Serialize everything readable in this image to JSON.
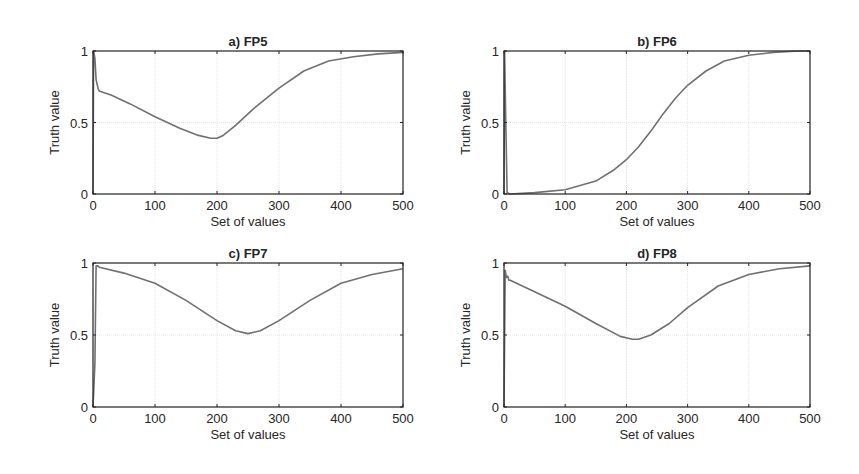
{
  "figure": {
    "line_color": "#707070",
    "axis_color": "#262626",
    "grid_color": "#e4e4e4"
  },
  "chart_data": [
    {
      "id": "a",
      "type": "line",
      "title": "a) FP5",
      "xlabel": "Set of values",
      "ylabel": "Truth value",
      "xlim": [
        0,
        500
      ],
      "ylim": [
        0,
        1
      ],
      "xticks": [
        0,
        100,
        200,
        300,
        400,
        500
      ],
      "yticks": [
        0,
        0.5,
        1
      ],
      "ytick_labels": [
        "0",
        "0.5",
        "1"
      ],
      "grid": true,
      "x": [
        0,
        1,
        3,
        5,
        8,
        10,
        30,
        60,
        100,
        140,
        170,
        190,
        200,
        210,
        230,
        260,
        300,
        340,
        380,
        420,
        460,
        500
      ],
      "y": [
        0,
        1,
        0.95,
        0.8,
        0.74,
        0.72,
        0.69,
        0.63,
        0.54,
        0.46,
        0.41,
        0.39,
        0.39,
        0.41,
        0.48,
        0.6,
        0.74,
        0.86,
        0.93,
        0.96,
        0.98,
        0.99
      ]
    },
    {
      "id": "b",
      "type": "line",
      "title": "b) FP6",
      "xlabel": "Set of values",
      "ylabel": "Truth value",
      "xlim": [
        0,
        500
      ],
      "ylim": [
        0,
        1
      ],
      "xticks": [
        0,
        100,
        200,
        300,
        400,
        500
      ],
      "yticks": [
        0,
        0.5,
        1
      ],
      "ytick_labels": [
        "0",
        "0.5",
        "1"
      ],
      "grid": true,
      "x": [
        0,
        1,
        3,
        5,
        10,
        50,
        100,
        150,
        180,
        200,
        220,
        240,
        250,
        260,
        280,
        300,
        330,
        360,
        400,
        440,
        480,
        500
      ],
      "y": [
        0,
        1,
        0.5,
        0.01,
        0.0,
        0.01,
        0.03,
        0.09,
        0.17,
        0.24,
        0.33,
        0.44,
        0.5,
        0.56,
        0.67,
        0.76,
        0.86,
        0.93,
        0.97,
        0.99,
        1.0,
        1.0
      ]
    },
    {
      "id": "c",
      "type": "line",
      "title": "c) FP7",
      "xlabel": "Set of values",
      "ylabel": "Truth value",
      "xlim": [
        0,
        500
      ],
      "ylim": [
        0,
        1
      ],
      "xticks": [
        0,
        100,
        200,
        300,
        400,
        500
      ],
      "yticks": [
        0,
        0.5,
        1
      ],
      "ytick_labels": [
        "0",
        "0.5",
        "1"
      ],
      "grid": true,
      "x": [
        0,
        3,
        5,
        8,
        10,
        50,
        100,
        150,
        200,
        230,
        250,
        270,
        300,
        350,
        400,
        450,
        500
      ],
      "y": [
        0,
        0.3,
        0.98,
        0.98,
        0.97,
        0.93,
        0.86,
        0.74,
        0.6,
        0.53,
        0.51,
        0.53,
        0.6,
        0.74,
        0.86,
        0.92,
        0.96
      ]
    },
    {
      "id": "d",
      "type": "line",
      "title": "d) FP8",
      "xlabel": "Set of values",
      "ylabel": "Truth value",
      "xlim": [
        0,
        500
      ],
      "ylim": [
        0,
        1
      ],
      "xticks": [
        0,
        100,
        200,
        300,
        400,
        500
      ],
      "yticks": [
        0,
        0.5,
        1
      ],
      "ytick_labels": [
        "0",
        "0.5",
        "1"
      ],
      "grid": true,
      "x": [
        0,
        2,
        4,
        6,
        8,
        10,
        50,
        100,
        150,
        190,
        210,
        220,
        240,
        270,
        300,
        350,
        400,
        450,
        500
      ],
      "y": [
        0,
        0.95,
        0.9,
        0.91,
        0.88,
        0.88,
        0.8,
        0.7,
        0.58,
        0.49,
        0.47,
        0.47,
        0.5,
        0.58,
        0.69,
        0.84,
        0.92,
        0.96,
        0.98
      ]
    }
  ]
}
